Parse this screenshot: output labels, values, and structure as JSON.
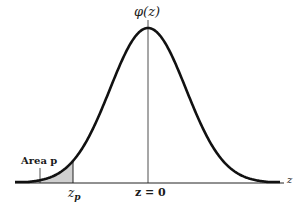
{
  "figure": {
    "curve_label": "φ(z)",
    "area_label": "Area p",
    "zp_label_main": "z",
    "zp_label_sub": "p",
    "z0_label": "z = 0",
    "axis_label": "z",
    "colors": {
      "curve": "#111111",
      "shade": "#cfcfcf",
      "axis": "#222222"
    }
  },
  "chart_data": {
    "type": "area",
    "title": "",
    "xlabel": "z",
    "ylabel": "φ(z)",
    "curve": "standard normal density",
    "annotations": [
      {
        "text": "φ(z)",
        "position": "above peak"
      },
      {
        "text": "Area p",
        "position": "left tail, shaded"
      },
      {
        "text": "z_p",
        "position": "right edge of shaded region"
      },
      {
        "text": "z = 0",
        "position": "center of distribution"
      },
      {
        "text": "z",
        "position": "right end of horizontal axis"
      }
    ],
    "shaded_region": {
      "from": "-inf",
      "to": "z_p"
    },
    "grid": false
  }
}
